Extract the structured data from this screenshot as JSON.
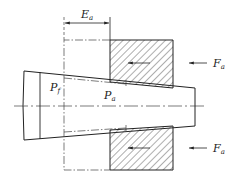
{
  "diagram": {
    "type": "mechanical cross-section",
    "labels": {
      "dimension": {
        "main": "E",
        "sub": "a"
      },
      "pf": {
        "main": "P",
        "sub": "f"
      },
      "pa": {
        "main": "P",
        "sub": "a"
      },
      "force_top": {
        "main": "F",
        "sub": "a"
      },
      "force_bottom": {
        "main": "F",
        "sub": "a"
      }
    },
    "colors": {
      "line": "#222222",
      "hatch": "#333333",
      "background": "#ffffff"
    }
  }
}
